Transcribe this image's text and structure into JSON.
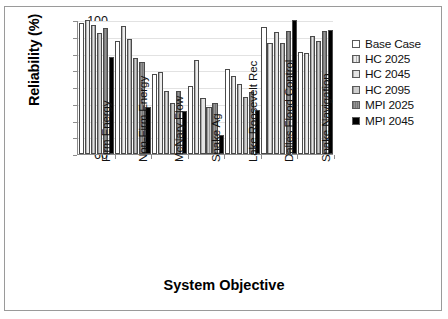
{
  "chart_data": {
    "type": "bar",
    "title": "",
    "xlabel": "System Objective",
    "ylabel": "Reliability (%)",
    "ylim": [
      60,
      100
    ],
    "yticks": [
      60,
      65,
      70,
      75,
      80,
      85,
      90,
      95,
      100
    ],
    "grid": true,
    "legend_position": "right",
    "categories": [
      "Firm Energy",
      "Non-Firm Energy",
      "McNary Flow",
      "Snake Ag",
      "Lake Roosevelt Rec",
      "Dalles Flood Control",
      "Snake Navigation"
    ],
    "series": [
      {
        "name": "Base Case",
        "color": "#ffffff",
        "values": [
          99.2,
          93.7,
          83.9,
          80.3,
          85.5,
          98.0,
          90.4
        ]
      },
      {
        "name": "HC 2025",
        "color": "#e6e6e6",
        "values": [
          100.0,
          98.1,
          84.5,
          88.0,
          83.3,
          93.0,
          90.2
        ]
      },
      {
        "name": "HC 2045",
        "color": "#dddddd",
        "values": [
          98.5,
          94.2,
          78.7,
          76.6,
          81.0,
          96.5,
          95.2
        ]
      },
      {
        "name": "HC 2095",
        "color": "#c8c8c8",
        "values": [
          96.0,
          88.7,
          75.2,
          74.0,
          77.1,
          93.2,
          93.6
        ]
      },
      {
        "name": "MPI 2025",
        "color": "#8e8e8e",
        "values": [
          97.5,
          87.6,
          78.9,
          75.2,
          78.4,
          96.6,
          96.6
        ]
      },
      {
        "name": "MPI 2045",
        "color": "#000000",
        "values": [
          89.1,
          73.9,
          72.9,
          65.6,
          73.2,
          100.0,
          97.1
        ]
      }
    ]
  }
}
